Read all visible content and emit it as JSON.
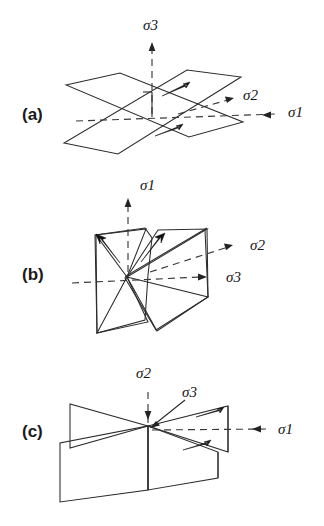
{
  "figure": {
    "background_color": "#ffffff",
    "line_color": "#2b2b2b",
    "panels": [
      {
        "tag": "(a)",
        "tag_x": 22,
        "tag_y": 120,
        "description": "conjugate low-angle fault planes with sigma3 vertical",
        "labels": [
          {
            "name": "sigma3",
            "text": "σ3",
            "x": 143,
            "y": 30
          },
          {
            "name": "sigma2",
            "text": "σ2",
            "x": 243,
            "y": 100
          },
          {
            "name": "sigma1",
            "text": "σ1",
            "x": 288,
            "y": 117
          }
        ]
      },
      {
        "tag": "(b)",
        "tag_x": 22,
        "tag_y": 280,
        "description": "conjugate steep fault planes with sigma1 vertical",
        "labels": [
          {
            "name": "sigma1",
            "text": "σ1",
            "x": 140,
            "y": 190
          },
          {
            "name": "sigma2",
            "text": "σ2",
            "x": 250,
            "y": 250
          },
          {
            "name": "sigma3",
            "text": "σ3",
            "x": 226,
            "y": 282
          }
        ]
      },
      {
        "tag": "(c)",
        "tag_x": 22,
        "tag_y": 437,
        "description": "vertical strike-slip fault planes with sigma2 vertical",
        "labels": [
          {
            "name": "sigma2",
            "text": "σ2",
            "x": 148,
            "y": 378
          },
          {
            "name": "sigma3",
            "text": "σ3",
            "x": 178,
            "y": 397
          },
          {
            "name": "sigma1",
            "text": "σ1",
            "x": 278,
            "y": 434
          }
        ]
      }
    ]
  }
}
